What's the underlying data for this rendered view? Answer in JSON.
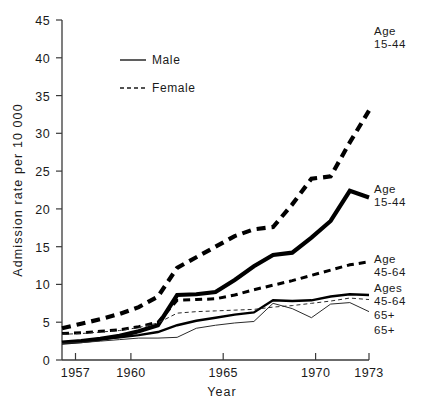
{
  "chart_data": {
    "type": "line",
    "title": "",
    "xlabel": "Year",
    "ylabel": "Admission rate  per  10 000",
    "xlim": [
      1957,
      1973
    ],
    "ylim": [
      0,
      45
    ],
    "xticks": [
      1957,
      1960,
      1965,
      1970,
      1973
    ],
    "xtick_labels": [
      "1957",
      "1960",
      "1965",
      "1970",
      "1973"
    ],
    "yticks": [
      0,
      5,
      10,
      15,
      20,
      25,
      30,
      35,
      40,
      45
    ],
    "ytick_labels": [
      "0",
      "5",
      "10",
      "15",
      "20",
      "25",
      "30",
      "35",
      "40",
      "45"
    ],
    "grid": false,
    "legend_position": "upper-left-inside",
    "legend": [
      {
        "name": "Male",
        "style": "solid"
      },
      {
        "name": "Female",
        "style": "dashed"
      }
    ],
    "x": [
      1957,
      1958,
      1959,
      1960,
      1961,
      1962,
      1963,
      1964,
      1965,
      1966,
      1967,
      1968,
      1969,
      1970,
      1971,
      1972,
      1973
    ],
    "series": [
      {
        "name": "Female 15-44",
        "sex": "Female",
        "age": "15-44",
        "style": "dashed",
        "weight": "heavy",
        "end_label_line1": "Age",
        "end_label_line2": "15-44",
        "values": [
          4.2,
          4.8,
          5.4,
          6.1,
          7.0,
          8.4,
          12.2,
          13.6,
          15.0,
          16.4,
          17.3,
          17.6,
          20.6,
          24.0,
          24.3,
          28.8,
          33.0
        ]
      },
      {
        "name": "Male 15-44",
        "sex": "Male",
        "age": "15-44",
        "style": "solid",
        "weight": "heavy",
        "end_label_line1": "Age",
        "end_label_line2": "15-44",
        "values": [
          2.3,
          2.5,
          2.8,
          3.2,
          3.8,
          4.6,
          8.6,
          8.7,
          9.0,
          10.6,
          12.4,
          13.9,
          14.2,
          16.2,
          18.4,
          22.4,
          21.5
        ]
      },
      {
        "name": "Female 45-64",
        "sex": "Female",
        "age": "45-64",
        "style": "dashed",
        "weight": "medium",
        "end_label_line1": "Age",
        "end_label_line2": "45-64",
        "values": [
          3.5,
          3.6,
          3.8,
          4.0,
          4.4,
          5.0,
          7.9,
          8.0,
          8.1,
          8.6,
          9.3,
          9.9,
          10.5,
          11.2,
          11.9,
          12.6,
          13.0
        ]
      },
      {
        "name": "Male 45-64",
        "sex": "Male",
        "age": "45-64",
        "style": "solid",
        "weight": "medium",
        "end_label_line1": "Ages",
        "end_label_line2": "45-64",
        "values": [
          2.3,
          2.5,
          2.8,
          3.0,
          3.3,
          3.7,
          4.6,
          5.2,
          5.6,
          6.0,
          6.3,
          7.9,
          7.8,
          7.9,
          8.4,
          8.7,
          8.6
        ]
      },
      {
        "name": "Female 65+",
        "sex": "Female",
        "age": "65+",
        "style": "dashed",
        "weight": "thin",
        "end_label_line1": "",
        "end_label_line2": "65+",
        "values": [
          3.4,
          3.5,
          3.7,
          3.9,
          4.3,
          4.9,
          6.2,
          6.4,
          6.5,
          6.6,
          6.7,
          7.0,
          7.2,
          7.5,
          7.8,
          8.2,
          8.0
        ]
      },
      {
        "name": "Male 65+",
        "sex": "Male",
        "age": "65+",
        "style": "solid",
        "weight": "thin",
        "end_label_line1": "",
        "end_label_line2": "65+",
        "values": [
          2.2,
          2.3,
          2.5,
          2.7,
          2.9,
          2.9,
          3.0,
          4.2,
          4.6,
          4.9,
          5.1,
          7.5,
          6.8,
          5.6,
          7.4,
          7.6,
          6.4
        ]
      }
    ]
  },
  "axes": {
    "y_title": "Admission rate  per  10 000",
    "x_title": "Year"
  },
  "legend": {
    "male_label": "Male",
    "female_label": "Female"
  },
  "series_labels": {
    "female_1544_l1": "Age",
    "female_1544_l2": "15-44",
    "male_1544_l1": "Age",
    "male_1544_l2": "15-44",
    "female_4564_l1": "Age",
    "female_4564_l2": "45-64",
    "male_4564_l1": "Ages",
    "male_4564_l2": "45-64",
    "female_65_l2": "65+",
    "male_65_l2": "65+"
  },
  "ticks": {
    "y": [
      "45",
      "40",
      "35",
      "30",
      "25",
      "20",
      "15",
      "10",
      "5",
      "0"
    ],
    "x": [
      "1957",
      "1960",
      "1965",
      "1970",
      "1973"
    ]
  },
  "colors": {
    "ink": "#000000",
    "axis": "#3a3a3a",
    "background": "#ffffff"
  }
}
